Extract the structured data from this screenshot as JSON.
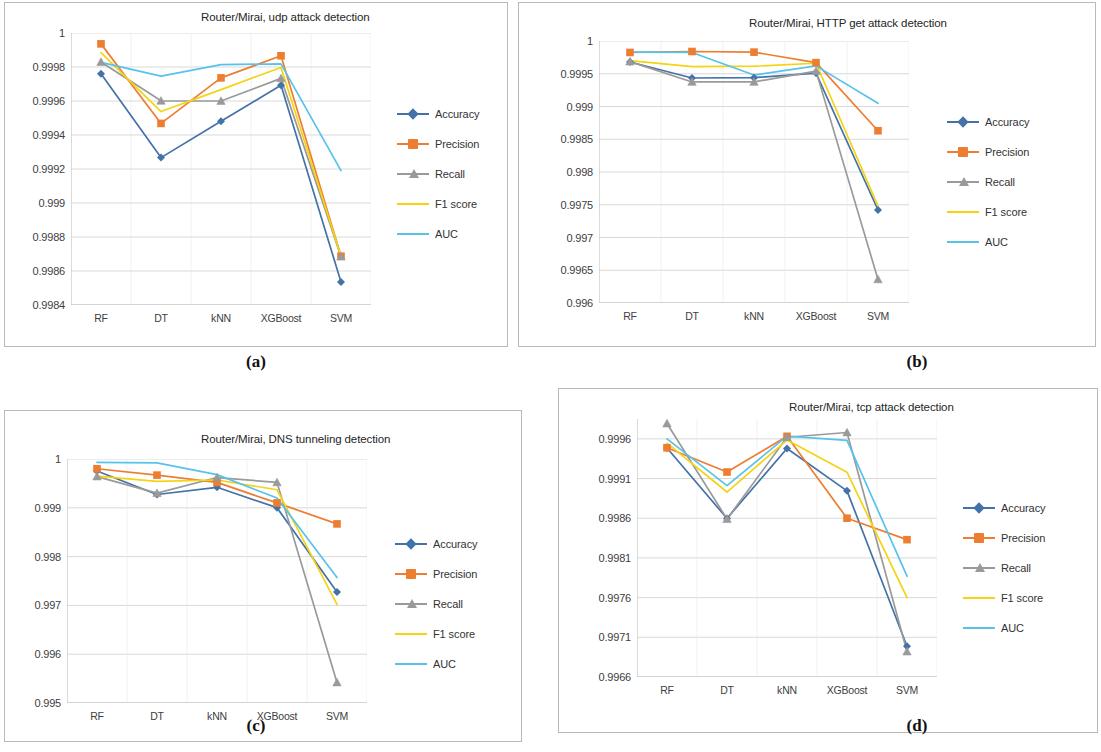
{
  "figure": {
    "captions": {
      "a": "(a)",
      "b": "(b)",
      "c": "(c)",
      "d": "(d)"
    }
  },
  "series_meta": [
    {
      "name": "Accuracy",
      "color": "#4472a8",
      "marker": "diamond"
    },
    {
      "name": "Precision",
      "color": "#ed7d31",
      "marker": "square"
    },
    {
      "name": "Recall",
      "color": "#9a9a9a",
      "marker": "triangle"
    },
    {
      "name": "F1 score",
      "color": "#f5d313",
      "marker": "none"
    },
    {
      "name": "AUC",
      "color": "#57c3ea",
      "marker": "none"
    }
  ],
  "chart_data": [
    {
      "id": "a",
      "type": "line",
      "title": "Router/Mirai, udp attack detection",
      "xlabel": "",
      "ylabel": "",
      "categories": [
        "RF",
        "DT",
        "kNN",
        "XGBoost",
        "SVM"
      ],
      "ylim": [
        0.9984,
        1.0
      ],
      "yticks": [
        "1",
        "0.9998",
        "0.9996",
        "0.9994",
        "0.9992",
        "0.999",
        "0.9988",
        "0.9986",
        "0.9984"
      ],
      "ytick_values": [
        1.0,
        0.9998,
        0.9996,
        0.9994,
        0.9992,
        0.999,
        0.9988,
        0.9986,
        0.9984
      ],
      "grid": true,
      "legend_position": "right",
      "series": [
        {
          "name": "Accuracy",
          "values": [
            0.99976,
            0.999267,
            0.999481,
            0.999693,
            0.998535
          ]
        },
        {
          "name": "Precision",
          "values": [
            0.999936,
            0.999468,
            0.999736,
            0.999866,
            0.998687
          ]
        },
        {
          "name": "Recall",
          "values": [
            0.999829,
            0.999601,
            0.9996,
            0.999733,
            0.998684
          ]
        },
        {
          "name": "F1 score",
          "values": [
            0.999885,
            0.999538,
            0.999667,
            0.999797,
            0.998687
          ]
        },
        {
          "name": "AUC",
          "values": [
            0.999827,
            0.999746,
            0.999814,
            0.999818,
            0.99919
          ]
        }
      ]
    },
    {
      "id": "b",
      "type": "line",
      "title": "Router/Mirai, HTTP get attack detection",
      "xlabel": "",
      "ylabel": "",
      "categories": [
        "RF",
        "DT",
        "kNN",
        "XGBoost",
        "SVM"
      ],
      "ylim": [
        0.996,
        1.0
      ],
      "yticks": [
        "1",
        "0.9995",
        "0.999",
        "0.9985",
        "0.998",
        "0.9975",
        "0.997",
        "0.9965",
        "0.996"
      ],
      "ytick_values": [
        1.0,
        0.9995,
        0.999,
        0.9985,
        0.998,
        0.9975,
        0.997,
        0.9965,
        0.996
      ],
      "grid": true,
      "legend_position": "right",
      "series": [
        {
          "name": "Accuracy",
          "values": [
            0.99968,
            0.999435,
            0.99944,
            0.99951,
            0.99742
          ]
        },
        {
          "name": "Precision",
          "values": [
            0.999825,
            0.99984,
            0.99983,
            0.99967,
            0.99863
          ]
        },
        {
          "name": "Recall",
          "values": [
            0.999685,
            0.999375,
            0.999375,
            0.99954,
            0.99636
          ]
        },
        {
          "name": "F1 score",
          "values": [
            0.9997,
            0.99961,
            0.999615,
            0.99966,
            0.99748
          ]
        },
        {
          "name": "AUC",
          "values": [
            0.99983,
            0.999825,
            0.99948,
            0.99962,
            0.99905
          ]
        }
      ]
    },
    {
      "id": "c",
      "type": "line",
      "title": "Router/Mirai, DNS tunneling detection",
      "xlabel": "",
      "ylabel": "",
      "categories": [
        "RF",
        "DT",
        "kNN",
        "XGBoost",
        "SVM"
      ],
      "ylim": [
        0.995,
        1.0
      ],
      "yticks": [
        "1",
        "0.999",
        "0.998",
        "0.997",
        "0.996",
        "0.995"
      ],
      "ytick_values": [
        1.0,
        0.999,
        0.998,
        0.997,
        0.996,
        0.995
      ],
      "grid": true,
      "legend_position": "right",
      "series": [
        {
          "name": "Accuracy",
          "values": [
            0.999755,
            0.999272,
            0.99942,
            0.999003,
            0.997275
          ]
        },
        {
          "name": "Precision",
          "values": [
            0.9998,
            0.99967,
            0.99952,
            0.9991,
            0.99867
          ]
        },
        {
          "name": "Recall",
          "values": [
            0.99964,
            0.9993,
            0.99962,
            0.99952,
            0.99542
          ]
        },
        {
          "name": "F1 score",
          "values": [
            0.99965,
            0.99954,
            0.99957,
            0.99937,
            0.99702
          ]
        },
        {
          "name": "AUC",
          "values": [
            0.99993,
            0.99992,
            0.99968,
            0.9992,
            0.99757
          ]
        }
      ]
    },
    {
      "id": "d",
      "type": "line",
      "title": "Router/Mirai, tcp attack detection",
      "xlabel": "",
      "ylabel": "",
      "categories": [
        "RF",
        "DT",
        "kNN",
        "XGBoost",
        "SVM"
      ],
      "ylim": [
        0.9966,
        0.99985
      ],
      "yticks": [
        "0.9996",
        "0.9991",
        "0.9986",
        "0.9981",
        "0.9976",
        "0.9971",
        "0.9966"
      ],
      "ytick_values": [
        0.9996,
        0.9991,
        0.9986,
        0.9981,
        0.9976,
        0.9971,
        0.9966
      ],
      "grid": true,
      "legend_position": "right",
      "series": [
        {
          "name": "Accuracy",
          "values": [
            0.999485,
            0.998598,
            0.999478,
            0.998945,
            0.996988
          ]
        },
        {
          "name": "Precision",
          "values": [
            0.999488,
            0.999182,
            0.999632,
            0.9986,
            0.99833
          ]
        },
        {
          "name": "Recall",
          "values": [
            0.999793,
            0.99859,
            0.99962,
            0.99968,
            0.99692
          ]
        },
        {
          "name": "F1 score",
          "values": [
            0.999545,
            0.99893,
            0.999585,
            0.99918,
            0.9976
          ]
        },
        {
          "name": "AUC",
          "values": [
            0.9996,
            0.99901,
            0.999635,
            0.99958,
            0.99787
          ]
        }
      ]
    }
  ]
}
